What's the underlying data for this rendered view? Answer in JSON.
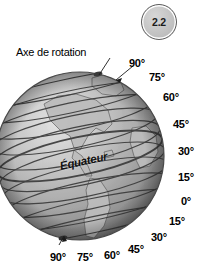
{
  "figure": {
    "badge_number": "2.2",
    "axis_label": "Axe de rotation",
    "equator_label": "Équateur",
    "colors": {
      "background": "#ffffff",
      "globe_light": "#d8d8d8",
      "globe_mid": "#a9a9a9",
      "globe_dark": "#6f6f6f",
      "grid_line": "#3a3a3a",
      "text": "#000000",
      "badge_fill": "#c6c6c6",
      "badge_stroke": "#5d5d5d"
    },
    "right_labels": [
      {
        "text": "90°",
        "x": 129,
        "y": 58
      },
      {
        "text": "75°",
        "x": 149,
        "y": 72
      },
      {
        "text": "60°",
        "x": 163,
        "y": 92
      },
      {
        "text": "45°",
        "x": 173,
        "y": 119
      },
      {
        "text": "30°",
        "x": 178,
        "y": 146
      },
      {
        "text": "15°",
        "x": 178,
        "y": 172
      },
      {
        "text": "0°",
        "x": 181,
        "y": 196
      },
      {
        "text": "15°",
        "x": 169,
        "y": 216
      },
      {
        "text": "30°",
        "x": 151,
        "y": 232
      },
      {
        "text": "45°",
        "x": 128,
        "y": 244
      }
    ],
    "bottom_labels": [
      {
        "text": "90°",
        "x": 50,
        "y": 252
      },
      {
        "text": "75°",
        "x": 77,
        "y": 252
      },
      {
        "text": "60°",
        "x": 104,
        "y": 250
      }
    ],
    "equator": {
      "x": 60,
      "y": 160
    },
    "globe": {
      "center_x": 80,
      "center_y": 156,
      "radius": 84,
      "tilt_deg": -12
    }
  }
}
